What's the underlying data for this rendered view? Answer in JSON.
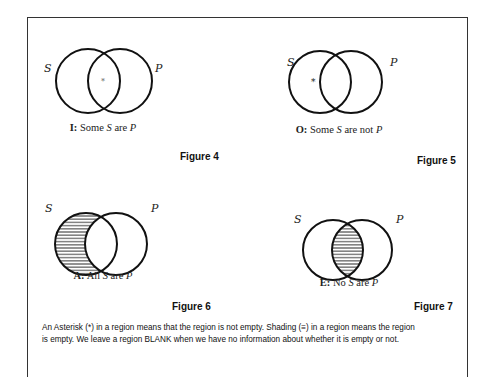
{
  "figures": [
    {
      "id": "figure-4",
      "label": "Figure 4",
      "circle_labels": {
        "left": "S",
        "right": "P"
      },
      "caption": {
        "letter": "I:",
        "text_before": " Some ",
        "var1": "S",
        "text_mid": " are ",
        "var2": "P",
        "text_after": ""
      },
      "marker": "*",
      "marker_region": "intersection",
      "shaded_region": "none"
    },
    {
      "id": "figure-5",
      "label": "Figure 5",
      "circle_labels": {
        "left": "S",
        "right": "P"
      },
      "caption": {
        "letter": "O:",
        "text_before": " Some ",
        "var1": "S",
        "text_mid": " are not ",
        "var2": "P",
        "text_after": ""
      },
      "marker": "*",
      "marker_region": "S-only",
      "shaded_region": "none"
    },
    {
      "id": "figure-6",
      "label": "Figure 6",
      "circle_labels": {
        "left": "S",
        "right": "P"
      },
      "caption": {
        "letter": "A:",
        "text_before": " All ",
        "var1": "S",
        "text_mid": " are ",
        "var2": "P",
        "text_after": ""
      },
      "marker": "",
      "marker_region": "none",
      "shaded_region": "S-only"
    },
    {
      "id": "figure-7",
      "label": "Figure 7",
      "circle_labels": {
        "left": "S",
        "right": "P"
      },
      "caption": {
        "letter": "E:",
        "text_before": " No ",
        "var1": "S",
        "text_mid": " are ",
        "var2": "P",
        "text_after": ""
      },
      "marker": "",
      "marker_region": "none",
      "shaded_region": "intersection"
    }
  ],
  "footnote": {
    "line1": "An Asterisk (*) in a region means that the region is not empty. Shading (≡) in a region means the region",
    "line2": "is empty. We leave a region BLANK when we have no information about whether it is empty or not."
  }
}
